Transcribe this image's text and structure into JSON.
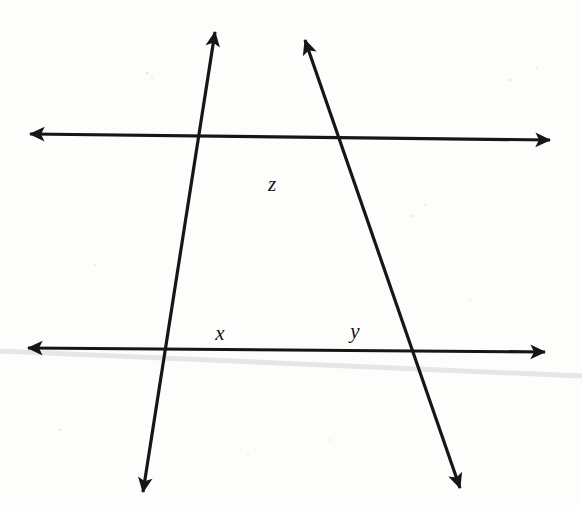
{
  "figure": {
    "width": 582,
    "height": 506,
    "background_color": "#fdfdfc",
    "ink_color": "#161616",
    "artifact_color": "#e3e3e3",
    "stroke_width": 3.2
  },
  "lines": [
    {
      "name": "upper-parallel-line",
      "role": "horizontal transversal-cut line (top)",
      "x1": 30,
      "y1": 134,
      "x2": 550,
      "y2": 140,
      "arrow_start": true,
      "arrow_end": true
    },
    {
      "name": "lower-parallel-line",
      "role": "horizontal transversal-cut line (bottom)",
      "x1": 28,
      "y1": 348,
      "x2": 545,
      "y2": 352,
      "arrow_start": true,
      "arrow_end": true
    },
    {
      "name": "left-transversal-line",
      "role": "transversal descending to the lower-left",
      "x1": 215,
      "y1": 32,
      "x2": 143,
      "y2": 492,
      "arrow_start": true,
      "arrow_end": true
    },
    {
      "name": "right-transversal-line",
      "role": "transversal descending to the lower-right",
      "x1": 305,
      "y1": 40,
      "x2": 460,
      "y2": 488,
      "arrow_start": true,
      "arrow_end": true
    }
  ],
  "intersections": [
    {
      "name": "apex-intersection",
      "x": 268,
      "y": 137,
      "description": "both transversals meet on the upper line"
    },
    {
      "name": "left-lower-intersection",
      "x": 196,
      "y": 348,
      "description": "left transversal meets lower line"
    },
    {
      "name": "right-lower-intersection",
      "x": 386,
      "y": 351,
      "description": "right transversal meets lower line"
    }
  ],
  "labels": [
    {
      "name": "angle-label-z",
      "text": "z",
      "x": 272,
      "y": 184,
      "font_size": 21,
      "at": "apex-intersection"
    },
    {
      "name": "angle-label-x",
      "text": "x",
      "x": 220,
      "y": 333,
      "font_size": 21,
      "at": "left-lower-intersection"
    },
    {
      "name": "angle-label-y",
      "text": "y",
      "x": 355,
      "y": 331,
      "font_size": 21,
      "at": "right-lower-intersection"
    }
  ],
  "artifacts": [
    {
      "name": "scanner-streak",
      "x1": 0,
      "y1": 351,
      "x2": 582,
      "y2": 376,
      "color": "#e6e6e6",
      "width": 5
    }
  ]
}
